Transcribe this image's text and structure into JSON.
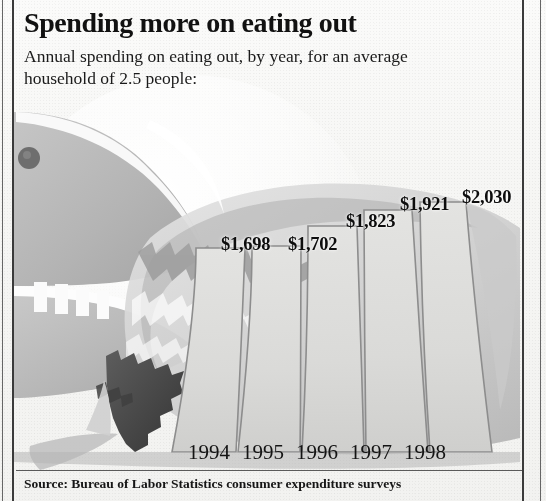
{
  "header": {
    "headline": "Spending more on eating out",
    "subhead": "Annual spending on eating out, by year, for an average household of 2.5 people:"
  },
  "source": {
    "text": "Source: Bureau of Labor Statistics consumer expenditure surveys"
  },
  "illustration": {
    "name": "shark-eating-chart",
    "eye_color": "#6b6b6b",
    "body_color": "#b9b9b9",
    "teeth_color": "#fafafa",
    "mouth_color": "#4a4a4a"
  },
  "palette": {
    "ink": "#111111",
    "bar_fill": "#dcdcdc",
    "bar_edge": "#8f8f8f",
    "paper": "#f6f6f4",
    "rule": "#3a3a3a"
  },
  "chart_data": {
    "type": "bar",
    "title": "Spending more on eating out",
    "subtitle": "Annual spending on eating out, by year, for an average household of 2.5 people:",
    "xlabel": "",
    "ylabel": "",
    "categories": [
      "1994",
      "1995",
      "1996",
      "1997",
      "1998"
    ],
    "values": [
      1698,
      1702,
      1823,
      1921,
      2030
    ],
    "value_labels": [
      "$1,698",
      "$1,702",
      "$1,823",
      "$1,921",
      "$2,030"
    ],
    "ylim": [
      0,
      2100
    ],
    "grid": false,
    "legend": false,
    "source": "Source: Bureau of Labor Statistics consumer expenditure surveys",
    "units": "US dollars per household per year"
  },
  "years": [
    {
      "label": "1994",
      "x": 188
    },
    {
      "label": "1995",
      "x": 242
    },
    {
      "label": "1996",
      "x": 296
    },
    {
      "label": "1997",
      "x": 350
    },
    {
      "label": "1998",
      "x": 404
    }
  ],
  "labels": [
    {
      "text": "$1,698",
      "x": 221,
      "y": 234
    },
    {
      "text": "$1,702",
      "x": 288,
      "y": 234
    },
    {
      "text": "$1,823",
      "x": 346,
      "y": 211
    },
    {
      "text": "$1,921",
      "x": 400,
      "y": 194
    },
    {
      "text": "$2,030",
      "x": 462,
      "y": 187
    }
  ]
}
